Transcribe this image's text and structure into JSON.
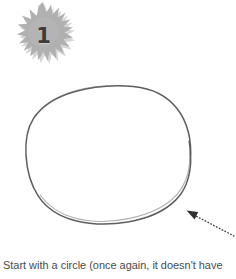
{
  "page": {
    "background_color": "#ffffff",
    "width": 236,
    "height": 279
  },
  "step_badge": {
    "number": "1",
    "shape": "starburst",
    "fill_color": "#b0b0b0",
    "shadow_color": "#d2d2d2",
    "number_color": "#3b3b3b"
  },
  "illustration": {
    "subject": "circle",
    "stroke_color": "#4f4f4f",
    "description": "hand-drawn circle outline",
    "callout_arrow": {
      "style": "dotted",
      "points_to": "lower-right edge of circle",
      "color": "#3d3d3d"
    }
  },
  "caption": {
    "text": "Start with a circle (once again, it doesn't have",
    "color": "#4a4a4a"
  }
}
